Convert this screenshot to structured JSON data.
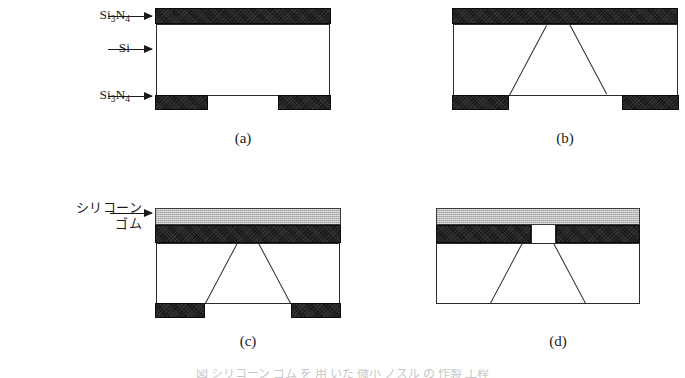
{
  "figure": {
    "title_visible": false,
    "background_color": "#ffffff",
    "ink_color": "#1a1a1a",
    "nitride_color": "#141414",
    "rubber_color": "#b9b9b9",
    "silicon_color": "#ffffff"
  },
  "labels": {
    "top_nitride": {
      "text": "Si3N4",
      "formula_base": "Si",
      "sub1": "3",
      "mid": "N",
      "sub2": "4"
    },
    "silicon": {
      "text": "Si"
    },
    "bottom_nitride": {
      "text": "Si3N4",
      "formula_base": "Si",
      "sub1": "3",
      "mid": "N",
      "sub2": "4"
    },
    "silicone_rubber": {
      "line1": "シリコーン",
      "line2": "ゴム"
    }
  },
  "panels": [
    {
      "id": "a",
      "caption": "(a)",
      "description": "Silicon wafer with Si3N4 on top surface and patterned Si3N4 mask on bottom surface",
      "has_rubber": false,
      "has_cavity": false,
      "has_bottom_pads": true,
      "has_through_hole": false
    },
    {
      "id": "b",
      "caption": "(b)",
      "description": "Anisotropically etched trapezoidal cavity in silicon stopping at top Si3N4 membrane",
      "has_rubber": false,
      "has_cavity": true,
      "has_bottom_pads": true,
      "has_through_hole": false
    },
    {
      "id": "c",
      "caption": "(c)",
      "description": "Silicone rubber layer applied over the top Si3N4 membrane",
      "has_rubber": true,
      "has_cavity": true,
      "has_bottom_pads": true,
      "has_through_hole": false
    },
    {
      "id": "d",
      "caption": "(d)",
      "description": "Si3N4 membrane opened to form a through hole; bottom Si3N4 mask removed",
      "has_rubber": true,
      "has_cavity": true,
      "has_bottom_pads": false,
      "has_through_hole": true
    }
  ],
  "bottom_caption": {
    "text": "図 シリコーン ゴム を 用 いた 微小 ノズル の 作製 工程"
  }
}
